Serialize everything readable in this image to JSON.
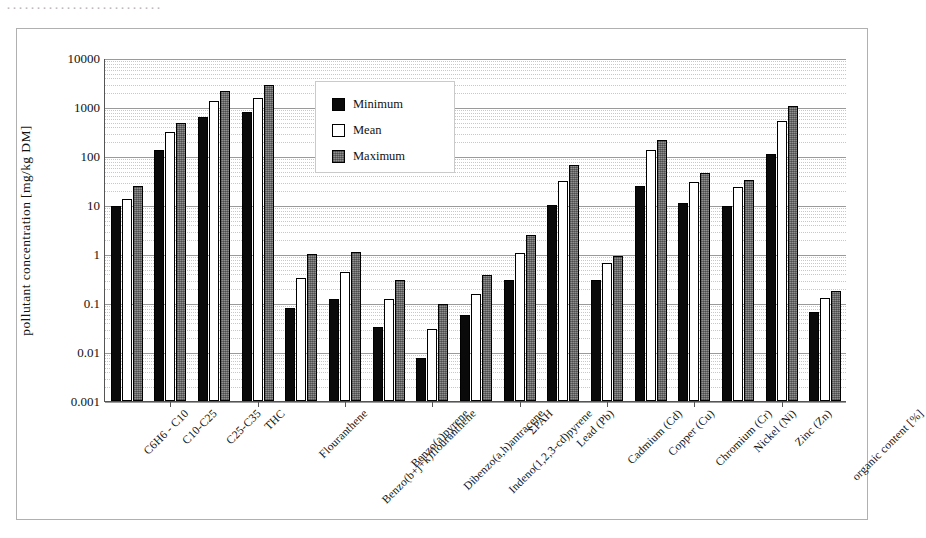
{
  "page": {
    "top_text_fragment": "··························"
  },
  "legend": {
    "position": "inside-top-center",
    "items": [
      {
        "label": "Minimum",
        "swatch": "black-square-icon",
        "color": "#0a0a0a"
      },
      {
        "label": "Mean",
        "swatch": "white-square-icon",
        "color": "#ffffff"
      },
      {
        "label": "Maximum",
        "swatch": "hatched-square-icon",
        "color": "#8f8f8f"
      }
    ]
  },
  "chart_data": {
    "type": "bar",
    "title": "",
    "xlabel": "",
    "ylabel": "pollutant concentration [mg/kg DM]",
    "yscale": "log",
    "ylim": [
      0.001,
      10000
    ],
    "ytick_labels": [
      "10000",
      "1000",
      "100",
      "10",
      "1",
      "0.1",
      "0.01",
      "0.001"
    ],
    "ytick_values": [
      10000,
      1000,
      100,
      10,
      1,
      0.1,
      0.01,
      0.001
    ],
    "grid": true,
    "categories": [
      "C6H6 - C10",
      "C10-C25",
      "C25-C35",
      "THC",
      "Flouranthene",
      "Benzo(b+j+k)flouranthene",
      "Benzo(a)pyrene",
      "Dibenzo(a,h)antracene",
      "Indeno(1,2,3-cd)pyrene",
      "ΣPAH",
      "Lead (Pb)",
      "Cadmium (Cd)",
      "Copper (Cu)",
      "Chromium (Cr)",
      "Nickel (Ni)",
      "Zinc (Zn)",
      "organic content [%]"
    ],
    "series": [
      {
        "name": "Minimum",
        "color": "#0a0a0a",
        "values": [
          9.5,
          130,
          620,
          800,
          0.08,
          0.12,
          0.033,
          0.0075,
          0.057,
          0.29,
          9.8,
          0.3,
          25,
          11,
          9.5,
          110,
          0.065
        ]
      },
      {
        "name": "Mean",
        "color": "#ffffff",
        "values": [
          13,
          310,
          1300,
          1500,
          0.33,
          0.43,
          0.12,
          0.03,
          0.15,
          1.05,
          31,
          0.65,
          130,
          29,
          23,
          530,
          0.125
        ]
      },
      {
        "name": "Maximum",
        "color": "#8f8f8f",
        "values": [
          24,
          480,
          2100,
          2800,
          0.98,
          1.1,
          0.3,
          0.095,
          0.38,
          2.5,
          65,
          0.9,
          215,
          45,
          32,
          1050,
          0.175
        ]
      }
    ]
  }
}
